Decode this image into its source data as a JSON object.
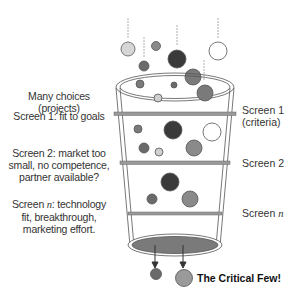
{
  "diagram": {
    "left_labels": {
      "many_choices": "Many choices (projects)",
      "screen1": "Screen 1: fit to goals",
      "screen2_line1": "Screen 2: market too",
      "screen2_line2": "small, no competence,",
      "screen2_line3": "partner available?",
      "screenn_line1_a": "Screen ",
      "screenn_line1_n": "n",
      "screenn_line1_b": ": technology",
      "screenn_line2": "fit, breakthrough,",
      "screenn_line3": "marketing effort."
    },
    "right_labels": {
      "screen1_line1": "Screen 1",
      "screen1_line2": "(criteria)",
      "screen2": "Screen 2",
      "screenn_a": "Screen ",
      "screenn_n": "n"
    },
    "output_label": "The Critical Few!",
    "colors": {
      "dark": "#3a3a3a",
      "mid_dark": "#6a6a6a",
      "mid": "#8a8a8a",
      "light": "#cfcfcf",
      "white": "#ffffff",
      "bar": "#9a9a9a",
      "bottom_fill": "#7a7a7a",
      "stroke": "#555555"
    }
  }
}
